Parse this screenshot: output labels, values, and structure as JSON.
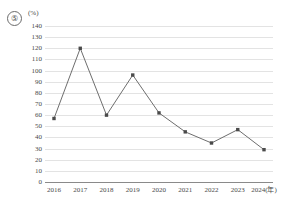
{
  "figure": {
    "number_label": "⑤",
    "y_axis_unit": "(%)"
  },
  "chart_data": {
    "type": "line",
    "title": "",
    "xlabel": "",
    "ylabel": "(%)",
    "categories": [
      "2016",
      "2017",
      "2018",
      "2019",
      "2020",
      "2021",
      "2022",
      "2023",
      "2024(年)"
    ],
    "x_tick_labels": [
      "2016",
      "2017",
      "2018",
      "2019",
      "2020",
      "2021",
      "2022",
      "2023",
      "2024(年)"
    ],
    "values": [
      57,
      120,
      60,
      96,
      62,
      45,
      35,
      47,
      29
    ],
    "series": [
      {
        "name": "",
        "values": [
          57,
          120,
          60,
          96,
          62,
          45,
          35,
          47,
          29
        ]
      }
    ],
    "y_tick_labels": [
      "140",
      "130",
      "120",
      "110",
      "100",
      "90",
      "80",
      "70",
      "60",
      "50",
      "40",
      "30",
      "20",
      "10",
      "0"
    ],
    "y_ticks": [
      140,
      130,
      120,
      110,
      100,
      90,
      80,
      70,
      60,
      50,
      40,
      30,
      20,
      10,
      0
    ],
    "ylim": [
      0,
      140
    ],
    "grid": true,
    "legend": "none",
    "marker": "square",
    "line_color": "#6e6e6e",
    "marker_color": "#4a4a4a",
    "grid_color": "#e3e3e3",
    "axis_color": "#8a8a8a"
  }
}
